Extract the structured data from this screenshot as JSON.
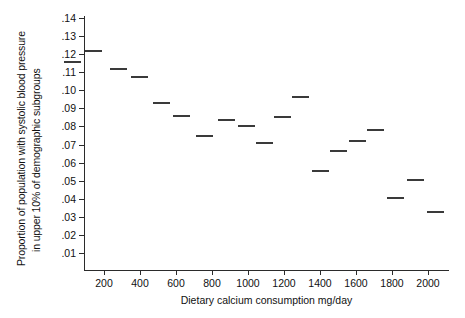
{
  "chart_data": {
    "type": "scatter",
    "marker": "horizontal-dash",
    "title": "",
    "xlabel": "Dietary calcium consumption mg/day",
    "ylabel": "Proportion of population with systolic blood pressure in upper 10% of demographic subgroups",
    "ylabel_lines": [
      "Proportion of population with systolic blood pressure",
      "in upper 10% of demographic subgroups"
    ],
    "xlim": [
      0,
      2175
    ],
    "ylim": [
      0,
      0.145
    ],
    "grid": false,
    "legend": null,
    "xticks": [
      200,
      400,
      600,
      800,
      1000,
      1200,
      1400,
      1600,
      1800,
      2000
    ],
    "xtick_labels": [
      "200",
      "400",
      "600",
      "800",
      "1000",
      "1200",
      "1400",
      "1600",
      "1800",
      "2000"
    ],
    "yticks": [
      0.01,
      0.02,
      0.03,
      0.04,
      0.05,
      0.06,
      0.07,
      0.08,
      0.09,
      0.1,
      0.11,
      0.12,
      0.13,
      0.14
    ],
    "ytick_labels": [
      ".01",
      ".02",
      ".03",
      ".04",
      ".05",
      ".06",
      ".07",
      ".08",
      ".09",
      ".10",
      ".11",
      ".12",
      ".13",
      ".14"
    ],
    "x": [
      25,
      140,
      280,
      395,
      520,
      630,
      760,
      880,
      990,
      1090,
      1190,
      1290,
      1400,
      1500,
      1610,
      1710,
      1820,
      1930,
      2040
    ],
    "y": [
      0.1155,
      0.1215,
      0.1115,
      0.1075,
      0.093,
      0.0855,
      0.0745,
      0.0835,
      0.08,
      0.071,
      0.085,
      0.0965,
      0.0555,
      0.0665,
      0.072,
      0.078,
      0.0405,
      0.0505,
      0.0325
    ],
    "series_name": "subgroup proportions",
    "point_color": "#3a3a3a",
    "axis_color": "#2b2b2b"
  }
}
